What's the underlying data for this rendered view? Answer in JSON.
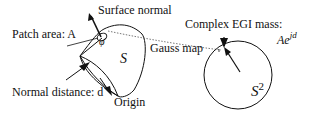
{
  "diagram": {
    "labels": {
      "surface_normal": "Surface normal",
      "patch_area": "Patch area: A",
      "normal_distance": "Normal distance: d",
      "origin": "Origin",
      "surface_symbol": "S",
      "gauss_map": "Gauss map",
      "complex_egi_mass": "Complex EGI mass:",
      "egi_formula_base": "Ae",
      "egi_formula_exp": "jd",
      "sphere_base": "S",
      "sphere_exp": "2",
      "angle_symbol": "φ"
    },
    "colors": {
      "stroke": "#111111",
      "dotted": "#555555",
      "background": "#ffffff"
    }
  }
}
